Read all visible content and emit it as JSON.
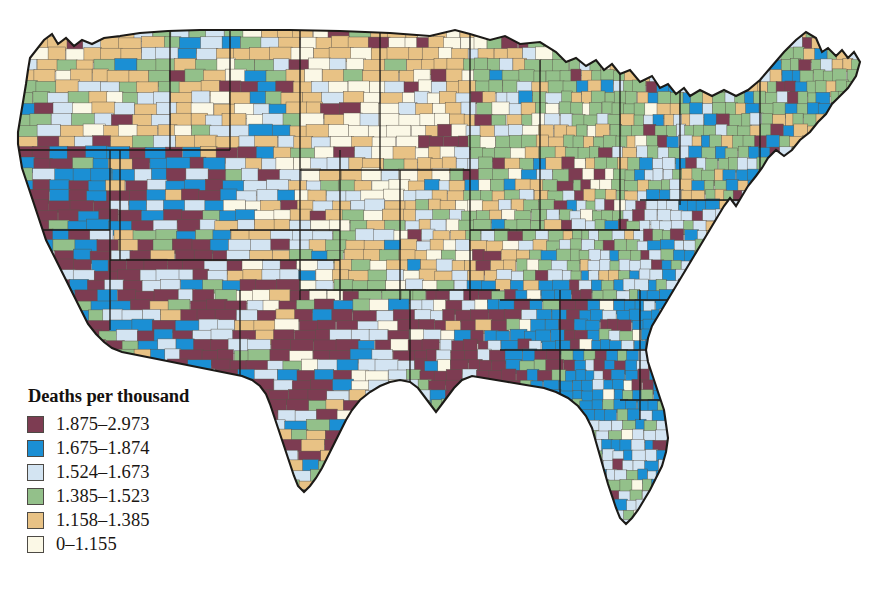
{
  "figure": {
    "type": "choropleth-map",
    "region": "United States (contiguous), county level",
    "background_color": "#ffffff",
    "border_color": "#1c1a17"
  },
  "legend": {
    "title": "Deaths per thousand",
    "position": "bottom-left",
    "entries": [
      {
        "label": "1.875–2.973",
        "color": "#7d3c52",
        "min": 1.875,
        "max": 2.973
      },
      {
        "label": "1.675–1.874",
        "color": "#1b8fd4",
        "min": 1.675,
        "max": 1.874
      },
      {
        "label": "1.524–1.673",
        "color": "#d3e4f2",
        "min": 1.524,
        "max": 1.673
      },
      {
        "label": "1.385–1.523",
        "color": "#93c08a",
        "min": 1.385,
        "max": 1.523
      },
      {
        "label": "1.158–1.385",
        "color": "#e8c285",
        "min": 1.158,
        "max": 1.385
      },
      {
        "label": "0–1.155",
        "color": "#fbf8e6",
        "min": 0,
        "max": 1.155
      }
    ]
  },
  "chart_data": {
    "type": "heatmap",
    "title": "Deaths per thousand",
    "subtitle": "",
    "xlabel": "",
    "ylabel": "",
    "legend_position": "bottom-left",
    "grid": false,
    "unit": "deaths per thousand",
    "classes": [
      {
        "label": "1.875–2.973",
        "color": "#7d3c52"
      },
      {
        "label": "1.675–1.874",
        "color": "#1b8fd4"
      },
      {
        "label": "1.524–1.673",
        "color": "#d3e4f2"
      },
      {
        "label": "1.385–1.523",
        "color": "#93c08a"
      },
      {
        "label": "1.158–1.385",
        "color": "#e8c285"
      },
      {
        "label": "0–1.155",
        "color": "#fbf8e6"
      }
    ],
    "regions": [
      {
        "name": "Pacific Northwest (WA, OR)",
        "dominant_class": "1.158–1.385",
        "notes": "tan with scattered pale blue and green"
      },
      {
        "name": "California",
        "dominant_class": "1.675–1.874",
        "notes": "bright blue coastal with maroon interior"
      },
      {
        "name": "Nevada / Arizona / Utah",
        "dominant_class": "1.875–2.973",
        "notes": "large maroon blocks"
      },
      {
        "name": "Northern Plains (ND, SD, MN, NE)",
        "dominant_class": "0–1.155",
        "notes": "cream and tan low-mortality belt"
      },
      {
        "name": "Upper Midwest (WI, MI)",
        "dominant_class": "1.385–1.523",
        "notes": "green"
      },
      {
        "name": "Appalachia / Mid-Atlantic",
        "dominant_class": "1.524–1.673",
        "notes": "pale blue"
      },
      {
        "name": "Deep South (MS, AL, GA, SC)",
        "dominant_class": "1.675–1.874",
        "notes": "bright blue with maroon patches"
      },
      {
        "name": "Texas / Oklahoma",
        "dominant_class": "1.875–2.973",
        "notes": "extensive maroon"
      },
      {
        "name": "Florida",
        "dominant_class": "1.524–1.673",
        "notes": "pale blue with green and blue mix"
      },
      {
        "name": "New England",
        "dominant_class": "1.385–1.523",
        "notes": "green with tan in Maine"
      }
    ]
  }
}
